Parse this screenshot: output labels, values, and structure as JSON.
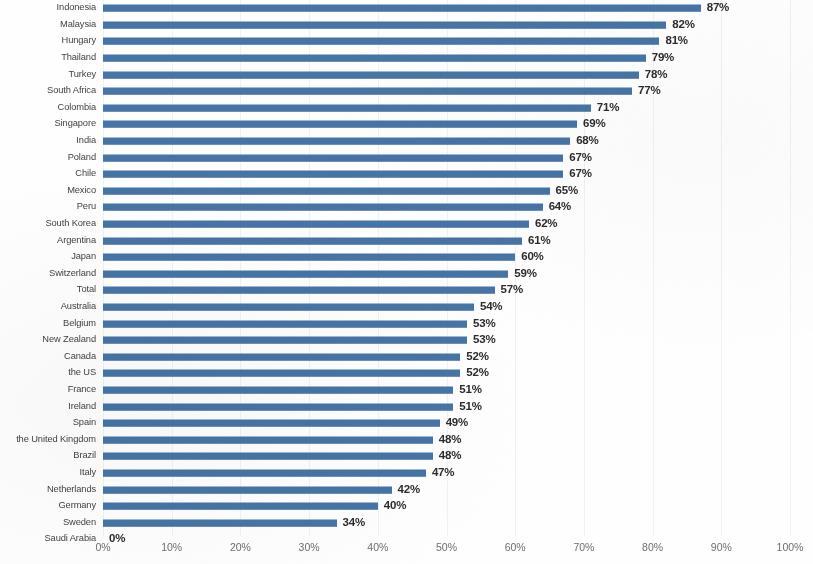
{
  "chart_data": {
    "type": "bar",
    "orientation": "horizontal",
    "title": "",
    "subtitle": "",
    "xlabel": "",
    "ylabel": "",
    "xlim": [
      0,
      100
    ],
    "value_suffix": "%",
    "grid": true,
    "grid_axis": "x",
    "legend": false,
    "legend_position": "none",
    "bar_color": "#4574a6",
    "label_color": "#2b2b2b",
    "tick_color": "#6e6e6e",
    "category_color": "#3f3f3f",
    "xticks": [
      0,
      10,
      20,
      30,
      40,
      50,
      60,
      70,
      80,
      90,
      100
    ],
    "xtick_labels": [
      "0%",
      "10%",
      "20%",
      "30%",
      "40%",
      "50%",
      "60%",
      "70%",
      "80%",
      "90%",
      "100%"
    ],
    "categories": [
      "Indonesia",
      "Malaysia",
      "Hungary",
      "Thailand",
      "Turkey",
      "South Africa",
      "Colombia",
      "Singapore",
      "India",
      "Poland",
      "Chile",
      "Mexico",
      "Peru",
      "South Korea",
      "Argentina",
      "Japan",
      "Switzerland",
      "Total",
      "Australia",
      "Belgium",
      "New Zealand",
      "Canada",
      "the US",
      "France",
      "Ireland",
      "Spain",
      "the United Kingdom",
      "Brazil",
      "Italy",
      "Netherlands",
      "Germany",
      "Sweden",
      "Saudi Arabia"
    ],
    "values": [
      87,
      82,
      81,
      79,
      78,
      77,
      71,
      69,
      68,
      67,
      67,
      65,
      64,
      62,
      61,
      60,
      59,
      57,
      54,
      53,
      53,
      52,
      52,
      51,
      51,
      49,
      48,
      48,
      47,
      42,
      40,
      34,
      0
    ],
    "value_labels": [
      "87%",
      "82%",
      "81%",
      "79%",
      "78%",
      "77%",
      "71%",
      "69%",
      "68%",
      "67%",
      "67%",
      "65%",
      "64%",
      "62%",
      "61%",
      "60%",
      "59%",
      "57%",
      "54%",
      "53%",
      "53%",
      "52%",
      "52%",
      "51%",
      "51%",
      "49%",
      "48%",
      "48%",
      "47%",
      "42%",
      "40%",
      "34%",
      "0%"
    ]
  }
}
